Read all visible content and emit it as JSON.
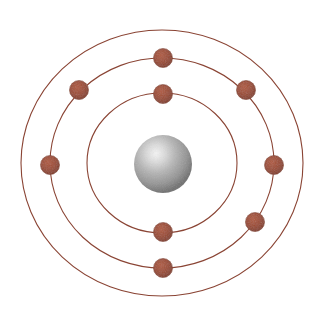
{
  "figure": {
    "width": 326,
    "height": 315,
    "background_color": "#ffffff"
  },
  "nucleus": {
    "label": "nucleus",
    "center_x": 163,
    "center_y": 164,
    "radius": 29,
    "highlight_color": "#f2f2f2",
    "mid_color": "#a8a8a8",
    "edge_color": "#6e6e6e",
    "highlight_offset_x": "38%",
    "highlight_offset_y": "32%"
  },
  "orbits": {
    "line_color": "#8a4434",
    "line_width": 1.1,
    "center_x": 162,
    "center_y": 163,
    "shells": [
      {
        "name": "shell-1",
        "rx": 75,
        "ry": 70
      },
      {
        "name": "shell-2",
        "rx": 112,
        "ry": 105
      },
      {
        "name": "shell-3",
        "rx": 141,
        "ry": 133
      }
    ]
  },
  "electrons": {
    "fill_color": "#9b4b33",
    "stroke_color": "#7d3a26",
    "radius": 9.5,
    "count": 9,
    "points": [
      {
        "name": "electron-shell1-top",
        "x": 163,
        "y": 94,
        "shell": "shell-1"
      },
      {
        "name": "electron-shell1-bottom",
        "x": 163,
        "y": 232,
        "shell": "shell-1"
      },
      {
        "name": "electron-shell2-top",
        "x": 163,
        "y": 58,
        "shell": "shell-2"
      },
      {
        "name": "electron-shell2-upper-left",
        "x": 79,
        "y": 90,
        "shell": "shell-2"
      },
      {
        "name": "electron-shell2-upper-right",
        "x": 246,
        "y": 90,
        "shell": "shell-2"
      },
      {
        "name": "electron-shell2-lower-right",
        "x": 255,
        "y": 222,
        "shell": "shell-2"
      },
      {
        "name": "electron-shell3-left",
        "x": 50,
        "y": 165,
        "shell": "shell-3"
      },
      {
        "name": "electron-shell3-right",
        "x": 274,
        "y": 165,
        "shell": "shell-3"
      },
      {
        "name": "electron-shell3-bottom",
        "x": 163,
        "y": 268,
        "shell": "shell-3"
      }
    ]
  }
}
